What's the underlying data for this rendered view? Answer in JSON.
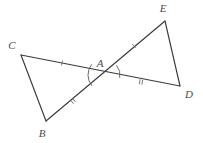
{
  "figure": {
    "background_color": "#ffffff",
    "line_color": "#3a3a3a",
    "mark_color": "#6b6b6b",
    "label_color": "#4a4a4a",
    "width": 203,
    "height": 143
  },
  "vertices": {
    "A": {
      "label": "A",
      "x": 105,
      "y": 75,
      "label_x": 100,
      "label_y": 64
    },
    "B": {
      "label": "B",
      "x": 46,
      "y": 121,
      "label_x": 42,
      "label_y": 134
    },
    "C": {
      "label": "C",
      "x": 21,
      "y": 55,
      "label_x": 12,
      "label_y": 46
    },
    "D": {
      "label": "D",
      "x": 180,
      "y": 86,
      "label_x": 189,
      "label_y": 95
    },
    "E": {
      "label": "E",
      "x": 165,
      "y": 21,
      "label_x": 163,
      "label_y": 9
    }
  },
  "segments": [
    {
      "name": "segment-CB",
      "from": "C",
      "to": "B",
      "x1": 21,
      "y1": 55,
      "x2": 46,
      "y2": 121
    },
    {
      "name": "segment-CD",
      "from": "C",
      "to": "D",
      "x1": 21,
      "y1": 55,
      "x2": 180,
      "y2": 86
    },
    {
      "name": "segment-BE",
      "from": "B",
      "to": "E",
      "x1": 46,
      "y1": 121,
      "x2": 165,
      "y2": 21
    },
    {
      "name": "segment-ED",
      "from": "E",
      "to": "D",
      "x1": 165,
      "y1": 21,
      "x2": 180,
      "y2": 86
    }
  ],
  "tick_marks": [
    {
      "name": "tick-CA",
      "segment": "CA",
      "count": 1,
      "x": 62,
      "y": 63,
      "angle": 11
    },
    {
      "name": "tick-AE",
      "segment": "AE",
      "count": 1,
      "x": 134,
      "y": 46,
      "angle": -40
    },
    {
      "name": "tick-AB",
      "segment": "AB",
      "count": 2,
      "x": 73,
      "y": 101,
      "angle": -40
    },
    {
      "name": "tick-AD",
      "segment": "AD",
      "count": 2,
      "x": 141,
      "y": 82,
      "angle": 11
    }
  ],
  "angle_arcs": [
    {
      "name": "angle-arc-BAC",
      "at": "A",
      "radius": 17,
      "start_deg": 140,
      "end_deg": 219
    },
    {
      "name": "angle-arc-DAE",
      "at": "A",
      "radius": 15,
      "start_deg": -40,
      "end_deg": 11
    }
  ],
  "congruence_notes": {
    "single_tick_pair": "CA = AE",
    "double_tick_pair": "AB = AD",
    "vertical_angles": "angle BAC = angle DAE"
  }
}
